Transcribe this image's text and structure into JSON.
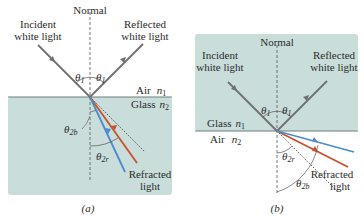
{
  "panel_a": {
    "caption": "(a)",
    "normal_label": "Normal",
    "incident_label_line1": "Incident",
    "incident_label_line2": "white light",
    "reflected_label_line1": "Reflected",
    "reflected_label_line2": "white light",
    "theta1_left": "θ",
    "theta1_left_sub": "1",
    "theta1_right": "θ",
    "theta1_right_sub": "1",
    "medium_top": "Air",
    "medium_top_index": "n",
    "medium_top_index_sub": "1",
    "medium_bottom": "Glass",
    "medium_bottom_index": "n",
    "medium_bottom_index_sub": "2",
    "theta2b": "θ",
    "theta2b_sub": "2b",
    "theta2r": "θ",
    "theta2r_sub": "2r",
    "refracted_label_line1": "Refracted",
    "refracted_label_line2": "light"
  },
  "panel_b": {
    "caption": "(b)",
    "normal_label": "Normal",
    "incident_label_line1": "Incident",
    "incident_label_line2": "white light",
    "reflected_label_line1": "Reflected",
    "reflected_label_line2": "white light",
    "theta1_left": "θ",
    "theta1_left_sub": "1",
    "theta1_right": "θ",
    "theta1_right_sub": "1",
    "medium_top": "Glass",
    "medium_top_index": "n",
    "medium_top_index_sub": "1",
    "medium_bottom": "Air",
    "medium_bottom_index": "n",
    "medium_bottom_index_sub": "2",
    "theta2r": "θ",
    "theta2r_sub": "2r",
    "theta2b": "θ",
    "theta2b_sub": "2b",
    "refracted_label_line1": "Refracted",
    "refracted_label_line2": "light"
  },
  "colors": {
    "glass": "#c9dedb",
    "white_ray": "#6f6f6f",
    "red_ray": "#c8502a",
    "blue_ray": "#4a8ccc",
    "text": "#2b2b2b"
  }
}
